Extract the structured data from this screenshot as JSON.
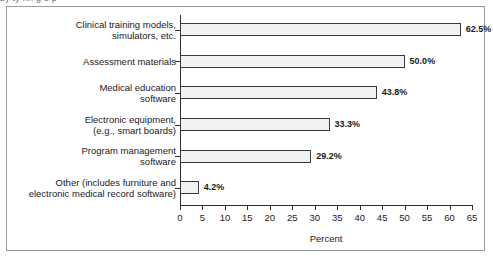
{
  "caption": {
    "sliver_text": "by  ty  rin  g  e  p"
  },
  "chart_data": {
    "type": "bar",
    "orientation": "horizontal",
    "title": "",
    "xlabel": "Percent",
    "ylabel": "",
    "xlim": [
      0,
      65
    ],
    "xticks": [
      0,
      5,
      10,
      15,
      20,
      25,
      30,
      35,
      40,
      45,
      50,
      55,
      60,
      65
    ],
    "grid": false,
    "legend": false,
    "categories": [
      "Clinical training models,\nsimulators, etc.",
      "Assessment materials",
      "Medical education\nsoftware",
      "Electronic equipment,\n(e.g., smart boards)",
      "Program management\nsoftware",
      "Other (includes furniture and\nelectronic medical record software)"
    ],
    "values": [
      62.5,
      50.0,
      43.8,
      33.3,
      29.2,
      4.2
    ],
    "value_labels": [
      "62.5%",
      "50.0%",
      "43.8%",
      "33.3%",
      "29.2%",
      "4.2%"
    ],
    "bar_fill": "#f1f1f1",
    "bar_border": "#3a3a3a",
    "axis_color": "#2b2b2b",
    "frame_color": "#9a9a9a"
  }
}
